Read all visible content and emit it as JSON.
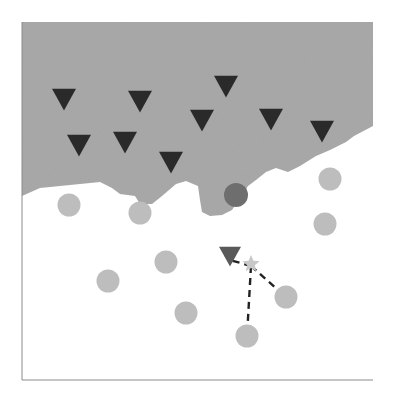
{
  "diagram": {
    "type": "knn-decision-boundary",
    "colors": {
      "region_class_a": "#a9a9a9",
      "region_class_b": "#ffffff",
      "triangle": "#2a2a2a",
      "circle": "#bdbdbd",
      "highlight_circle": "#6e6e6e",
      "query_triangle": "#5a5a5a",
      "query_star": "#c8c8c8",
      "dash": "#222222",
      "axis": "#8a8a8a"
    },
    "region_boundary": [
      [
        22,
        196
      ],
      [
        40,
        188
      ],
      [
        60,
        186
      ],
      [
        80,
        184
      ],
      [
        100,
        182
      ],
      [
        112,
        188
      ],
      [
        120,
        194
      ],
      [
        135,
        196
      ],
      [
        140,
        204
      ],
      [
        152,
        204
      ],
      [
        162,
        196
      ],
      [
        176,
        184
      ],
      [
        186,
        181
      ],
      [
        198,
        186
      ],
      [
        200,
        200
      ],
      [
        202,
        212
      ],
      [
        210,
        216
      ],
      [
        222,
        215
      ],
      [
        232,
        210
      ],
      [
        240,
        198
      ],
      [
        248,
        186
      ],
      [
        256,
        180
      ],
      [
        266,
        172
      ],
      [
        276,
        168
      ],
      [
        288,
        172
      ],
      [
        300,
        166
      ],
      [
        316,
        156
      ],
      [
        330,
        150
      ],
      [
        346,
        142
      ],
      [
        354,
        136
      ],
      [
        373,
        126
      ]
    ],
    "triangles": [
      {
        "x": 64,
        "y": 99
      },
      {
        "x": 140,
        "y": 101
      },
      {
        "x": 226,
        "y": 86
      },
      {
        "x": 79,
        "y": 145
      },
      {
        "x": 125,
        "y": 142
      },
      {
        "x": 202,
        "y": 120
      },
      {
        "x": 171,
        "y": 162
      },
      {
        "x": 271,
        "y": 119
      },
      {
        "x": 322,
        "y": 131
      }
    ],
    "circles": [
      {
        "x": 69,
        "y": 205
      },
      {
        "x": 140,
        "y": 213
      },
      {
        "x": 330,
        "y": 179
      },
      {
        "x": 325,
        "y": 224
      },
      {
        "x": 166,
        "y": 262
      },
      {
        "x": 108,
        "y": 281
      },
      {
        "x": 186,
        "y": 313
      },
      {
        "x": 286,
        "y": 297
      },
      {
        "x": 247,
        "y": 336
      }
    ],
    "highlight_circle": {
      "x": 236,
      "y": 195
    },
    "query_triangle": {
      "x": 230,
      "y": 256
    },
    "query_star": {
      "x": 251,
      "y": 264
    },
    "dashed_links": [
      {
        "from": {
          "x": 251,
          "y": 266
        },
        "to": {
          "x": 230,
          "y": 260
        }
      },
      {
        "from": {
          "x": 251,
          "y": 266
        },
        "to": {
          "x": 286,
          "y": 297
        }
      },
      {
        "from": {
          "x": 251,
          "y": 266
        },
        "to": {
          "x": 247,
          "y": 336
        }
      }
    ],
    "axes": {
      "left_x": 22,
      "bottom_y": 380,
      "top_y": 22,
      "right_x": 373
    }
  }
}
